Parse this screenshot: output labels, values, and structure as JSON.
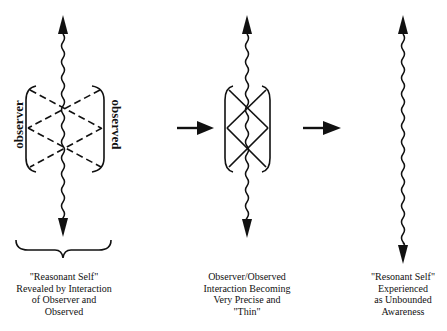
{
  "figure": {
    "panels": [
      {
        "id": "panel-1",
        "labels": {
          "left": "observer",
          "right": "observed"
        },
        "caption_lines": [
          "\"Reasonant Self\"",
          "Revealed by Interaction",
          "of Observer and",
          "Observed"
        ],
        "line_style": "dashed"
      },
      {
        "id": "panel-2",
        "caption_lines": [
          "Observer/Observed",
          "Interaction Becoming",
          "Very Precise and",
          "\"Thin\""
        ],
        "line_style": "solid"
      },
      {
        "id": "panel-3",
        "caption_lines": [
          "\"Resonant Self\"",
          "Experienced",
          "as Unbounded",
          "Awareness"
        ],
        "line_style": "none"
      }
    ],
    "transition_arrows": 2,
    "colors": {
      "ink": "#111111",
      "background": "#ffffff"
    }
  }
}
